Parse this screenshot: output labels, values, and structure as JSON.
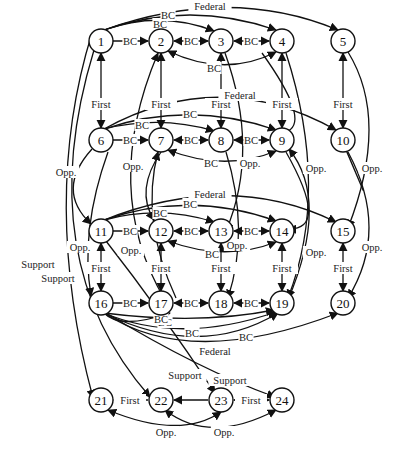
{
  "diagram": {
    "nodes": [
      {
        "id": "1",
        "x": 101,
        "y": 41
      },
      {
        "id": "2",
        "x": 161,
        "y": 41
      },
      {
        "id": "3",
        "x": 221,
        "y": 41
      },
      {
        "id": "4",
        "x": 282,
        "y": 41
      },
      {
        "id": "5",
        "x": 343,
        "y": 41
      },
      {
        "id": "6",
        "x": 101,
        "y": 140
      },
      {
        "id": "7",
        "x": 161,
        "y": 140
      },
      {
        "id": "8",
        "x": 221,
        "y": 140
      },
      {
        "id": "9",
        "x": 282,
        "y": 140
      },
      {
        "id": "10",
        "x": 343,
        "y": 140
      },
      {
        "id": "11",
        "x": 101,
        "y": 231
      },
      {
        "id": "12",
        "x": 161,
        "y": 231
      },
      {
        "id": "13",
        "x": 221,
        "y": 231
      },
      {
        "id": "14",
        "x": 282,
        "y": 231
      },
      {
        "id": "15",
        "x": 343,
        "y": 231
      },
      {
        "id": "16",
        "x": 101,
        "y": 303
      },
      {
        "id": "17",
        "x": 161,
        "y": 303
      },
      {
        "id": "18",
        "x": 221,
        "y": 303
      },
      {
        "id": "19",
        "x": 282,
        "y": 303
      },
      {
        "id": "20",
        "x": 343,
        "y": 303
      },
      {
        "id": "21",
        "x": 101,
        "y": 400
      },
      {
        "id": "22",
        "x": 161,
        "y": 400
      },
      {
        "id": "23",
        "x": 221,
        "y": 400
      },
      {
        "id": "24",
        "x": 282,
        "y": 400
      }
    ],
    "edge_labels": {
      "bc": "BC",
      "first": "First",
      "federal": "Federal",
      "opp": "Opp.",
      "support": "Support"
    },
    "edges": [
      {
        "d": "M112,41 L148,41",
        "label": "BC",
        "lx": 130,
        "ly": 41,
        "end": true,
        "start": false
      },
      {
        "d": "M174,41 L208,41",
        "label": "BC",
        "lx": 191,
        "ly": 41,
        "end": true,
        "start": true
      },
      {
        "d": "M234,41 L269,41",
        "label": "BC",
        "lx": 251,
        "ly": 41,
        "end": true,
        "start": true
      },
      {
        "d": "M104,30 Q160,10 214,31",
        "label": "BC",
        "lx": 160,
        "ly": 24,
        "end": true,
        "start": false
      },
      {
        "d": "M104,30 Q190,0 276,30",
        "label": "BC",
        "lx": 168,
        "ly": 15,
        "end": true,
        "start": false
      },
      {
        "d": "M104,30 Q230,-15 338,30",
        "label": "Federal",
        "lx": 210,
        "ly": 6,
        "end": true,
        "start": false
      },
      {
        "d": "M168,51 Q225,78 276,52",
        "label": "BC",
        "lx": 214,
        "ly": 68,
        "end": true,
        "start": true
      },
      {
        "d": "M101,53 L101,128",
        "label": "First",
        "lx": 101,
        "ly": 104,
        "end": true,
        "start": true
      },
      {
        "d": "M161,53 L161,128",
        "label": "First",
        "lx": 161,
        "ly": 104,
        "end": true,
        "start": true
      },
      {
        "d": "M221,53 L221,128",
        "label": "First",
        "lx": 221,
        "ly": 104,
        "end": true,
        "start": true
      },
      {
        "d": "M282,53 L282,128",
        "label": "First",
        "lx": 282,
        "ly": 104,
        "end": true,
        "start": true
      },
      {
        "d": "M343,53 L343,128",
        "label": "First",
        "lx": 343,
        "ly": 104,
        "end": true,
        "start": true
      },
      {
        "d": "M104,129 Q220,65 336,130",
        "label": "Federal",
        "lx": 240,
        "ly": 95,
        "end": true,
        "start": false
      },
      {
        "d": "M112,140 L148,140",
        "label": "BC",
        "lx": 130,
        "ly": 140,
        "end": true,
        "start": false
      },
      {
        "d": "M174,140 L208,140",
        "label": "BC",
        "lx": 191,
        "ly": 140,
        "end": true,
        "start": true
      },
      {
        "d": "M234,140 L269,140",
        "label": "BC",
        "lx": 251,
        "ly": 140,
        "end": true,
        "start": true
      },
      {
        "d": "M104,129 Q160,115 214,131",
        "label": "BC",
        "lx": 142,
        "ly": 125,
        "end": true,
        "start": false
      },
      {
        "d": "M104,129 Q190,100 276,130",
        "label": "BC",
        "lx": 190,
        "ly": 114,
        "end": true,
        "start": false
      },
      {
        "d": "M168,150 Q225,172 276,151",
        "label": "BC",
        "lx": 211,
        "ly": 163,
        "end": true,
        "start": true
      },
      {
        "d": "M101,243 L101,291",
        "label": "First",
        "lx": 101,
        "ly": 268,
        "end": true,
        "start": true
      },
      {
        "d": "M161,243 L161,291",
        "label": "First",
        "lx": 161,
        "ly": 268,
        "end": true,
        "start": true
      },
      {
        "d": "M221,243 L221,291",
        "label": "First",
        "lx": 221,
        "ly": 268,
        "end": true,
        "start": true
      },
      {
        "d": "M282,243 L282,291",
        "label": "First",
        "lx": 282,
        "ly": 268,
        "end": true,
        "start": true
      },
      {
        "d": "M343,243 L343,291",
        "label": "First",
        "lx": 343,
        "ly": 268,
        "end": true,
        "start": true
      },
      {
        "d": "M112,231 L148,231",
        "label": "BC",
        "lx": 130,
        "ly": 231,
        "end": true,
        "start": false
      },
      {
        "d": "M174,231 L208,231",
        "label": "BC",
        "lx": 191,
        "ly": 231,
        "end": true,
        "start": true
      },
      {
        "d": "M234,231 L269,231",
        "label": "BC",
        "lx": 251,
        "ly": 231,
        "end": true,
        "start": true
      },
      {
        "d": "M104,220 Q160,205 214,222",
        "label": "BC",
        "lx": 160,
        "ly": 213,
        "end": true,
        "start": false
      },
      {
        "d": "M104,220 Q190,190 276,221",
        "label": "BC",
        "lx": 190,
        "ly": 204,
        "end": true,
        "start": false
      },
      {
        "d": "M104,220 Q230,170 336,222",
        "label": "Federal",
        "lx": 210,
        "ly": 194,
        "end": true,
        "start": false
      },
      {
        "d": "M168,241 Q225,262 276,242",
        "label": "BC",
        "lx": 212,
        "ly": 254,
        "end": true,
        "start": true
      },
      {
        "d": "M112,303 L148,303",
        "label": "BC",
        "lx": 130,
        "ly": 303,
        "end": true,
        "start": false
      },
      {
        "d": "M174,303 L208,303",
        "label": "BC",
        "lx": 191,
        "ly": 303,
        "end": true,
        "start": true
      },
      {
        "d": "M234,303 L269,303",
        "label": "BC",
        "lx": 251,
        "ly": 303,
        "end": true,
        "start": true
      },
      {
        "d": "M104,313 Q200,325 274,310",
        "label": "BC",
        "lx": 165,
        "ly": 322,
        "end": true,
        "start": false
      },
      {
        "d": "M104,313 Q120,330 170,313",
        "label": "BC",
        "lx": 161,
        "ly": 319,
        "end": true,
        "start": false
      },
      {
        "d": "M104,313 Q180,345 276,312",
        "label": "BC",
        "lx": 192,
        "ly": 333,
        "end": true,
        "start": false
      },
      {
        "d": "M104,313 Q200,360 278,313",
        "label": "BC",
        "lx": 246,
        "ly": 337,
        "end": true,
        "start": false
      },
      {
        "d": "M104,313 Q190,370 338,313",
        "label": "Federal",
        "lx": 215,
        "ly": 351,
        "end": true,
        "start": false
      },
      {
        "d": "M92,149 Q55,190 91,224",
        "label": "Opp.",
        "lx": 66,
        "ly": 172,
        "end": true,
        "start": false
      },
      {
        "d": "M108,152 Q80,230 91,296",
        "label": "Opp.",
        "lx": 80,
        "ly": 247,
        "end": true,
        "start": false
      },
      {
        "d": "M92,33 Q40,200 93,398",
        "label": "Support",
        "lx": 38,
        "ly": 264,
        "end": true,
        "start": false
      },
      {
        "d": "M94,50 Q30,260 150,397",
        "label": "Support",
        "lx": 58,
        "ly": 278,
        "end": true,
        "start": false
      },
      {
        "d": "M161,152 Q135,190 154,220",
        "label": "Opp.",
        "lx": 133,
        "ly": 166,
        "end": true,
        "start": false
      },
      {
        "d": "M176,298 Q140,220 158,152",
        "label": "Opp.",
        "lx": 131,
        "ly": 250,
        "end": true,
        "start": false
      },
      {
        "d": "M165,300 Q100,190 158,53",
        "label": "",
        "lx": 0,
        "ly": 0,
        "end": true,
        "start": false
      },
      {
        "d": "M225,53 Q260,150 226,231",
        "label": "Opp.",
        "lx": 250,
        "ly": 163,
        "end": true,
        "start": false
      },
      {
        "d": "M226,152 Q250,230 228,298",
        "label": "Opp.",
        "lx": 237,
        "ly": 245,
        "end": true,
        "start": false
      },
      {
        "d": "M262,53 Q310,120 288,131",
        "label": "",
        "lx": 0,
        "ly": 0,
        "end": false,
        "start": false
      },
      {
        "d": "M286,152 Q330,230 288,229",
        "label": "Opp.",
        "lx": 316,
        "ly": 168,
        "end": true,
        "start": false
      },
      {
        "d": "M286,53 Q330,190 288,298",
        "label": "Opp.",
        "lx": 316,
        "ly": 252,
        "end": true,
        "start": false
      },
      {
        "d": "M288,300 Q330,200 289,149",
        "label": "",
        "lx": 0,
        "ly": 0,
        "end": true,
        "start": false
      },
      {
        "d": "M348,52 Q390,120 348,228",
        "label": "Opp.",
        "lx": 372,
        "ly": 168,
        "end": true,
        "start": false
      },
      {
        "d": "M348,152 Q390,230 348,298",
        "label": "Opp.",
        "lx": 372,
        "ly": 247,
        "end": true,
        "start": false
      },
      {
        "d": "M347,152 Q380,230 346,150",
        "label": "",
        "lx": 0,
        "ly": 0,
        "end": false,
        "start": false
      },
      {
        "d": "M106,241 Q160,310 215,393",
        "label": "Support",
        "lx": 185,
        "ly": 375,
        "end": true,
        "start": false
      },
      {
        "d": "M106,313 Q200,370 275,397",
        "label": "Support",
        "lx": 230,
        "ly": 380,
        "end": true,
        "start": false
      },
      {
        "d": "M148,400 L114,400",
        "label": "First",
        "lx": 130,
        "ly": 400,
        "end": true,
        "start": false
      },
      {
        "d": "M208,400 L174,400",
        "label": "",
        "lx": 0,
        "ly": 0,
        "end": true,
        "start": false
      },
      {
        "d": "M234,400 L269,400",
        "label": "First",
        "lx": 251,
        "ly": 400,
        "end": true,
        "start": true
      },
      {
        "d": "M221,412 Q180,440 108,410",
        "label": "Opp.",
        "lx": 166,
        "ly": 432,
        "end": true,
        "start": true
      },
      {
        "d": "M165,410 Q210,445 276,410",
        "label": "Opp.",
        "lx": 224,
        "ly": 432,
        "end": true,
        "start": true
      }
    ]
  }
}
